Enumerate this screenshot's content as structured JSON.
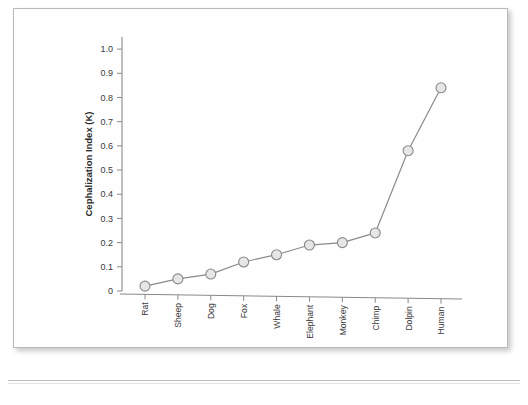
{
  "document": {
    "kind": "scanned-figure-page"
  },
  "chart_data": {
    "type": "line",
    "title": "",
    "subtitle": "",
    "xlabel": "Species",
    "ylabel": "Cephalization Index (K)",
    "categories": [
      "Rat",
      "Sheep",
      "Dog",
      "Fox",
      "Whale",
      "Elephant",
      "Monkey",
      "Chimp",
      "Dolpin",
      "Human"
    ],
    "values": [
      0.02,
      0.05,
      0.07,
      0.12,
      0.15,
      0.19,
      0.2,
      0.24,
      0.58,
      0.84
    ],
    "series": [
      {
        "name": "Cephalization Index (K)",
        "values": [
          0.02,
          0.05,
          0.07,
          0.12,
          0.15,
          0.19,
          0.2,
          0.24,
          0.58,
          0.84
        ]
      }
    ],
    "ylim": [
      0,
      1.05
    ],
    "y_ticks": [
      "0",
      "0.1",
      "0.2",
      "0.3",
      "0.4",
      "0.5",
      "0.6",
      "0.7",
      "0.8",
      "0.9",
      "1.0"
    ],
    "y_tick_values": [
      0,
      0.1,
      0.2,
      0.3,
      0.4,
      0.5,
      0.6,
      0.7,
      0.8,
      0.9,
      1.0
    ],
    "grid": false,
    "legend": false,
    "legend_position": "none",
    "marker": "circle",
    "colors": {
      "line": "#8a8a8a",
      "marker_fill": "#e6e6e6",
      "marker_edge": "#8a8a8a",
      "axis": "#8a8a8a",
      "text": "#3a3a3a"
    }
  }
}
